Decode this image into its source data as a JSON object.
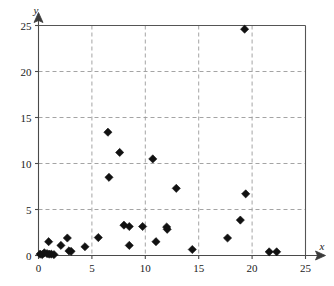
{
  "chart_data": {
    "type": "scatter",
    "title": "",
    "subtitle": "",
    "xlabel": "x",
    "ylabel": "y",
    "xlim": [
      0,
      25
    ],
    "ylim": [
      0,
      25
    ],
    "xticks": [
      0,
      5,
      10,
      15,
      20,
      25
    ],
    "yticks": [
      0,
      5,
      10,
      15,
      20,
      25
    ],
    "xtick_labels": [
      "0",
      "5",
      "10",
      "15",
      "20",
      "25"
    ],
    "ytick_labels": [
      "0",
      "5",
      "10",
      "15",
      "20",
      "25"
    ],
    "grid": true,
    "grid_style": "dashed",
    "legend": "none",
    "marker": "diamond",
    "marker_color": "#111111",
    "series": [
      {
        "name": "data",
        "points": [
          [
            0.15,
            0.15
          ],
          [
            0.35,
            0.1
          ],
          [
            0.55,
            0.3
          ],
          [
            0.8,
            0.2
          ],
          [
            0.95,
            1.5
          ],
          [
            1.0,
            0.15
          ],
          [
            1.2,
            0.15
          ],
          [
            1.45,
            0.1
          ],
          [
            2.1,
            1.1
          ],
          [
            2.7,
            1.9
          ],
          [
            2.85,
            0.5
          ],
          [
            3.05,
            0.45
          ],
          [
            4.35,
            0.95
          ],
          [
            5.6,
            1.95
          ],
          [
            6.5,
            13.4
          ],
          [
            6.6,
            8.5
          ],
          [
            7.6,
            11.2
          ],
          [
            8.0,
            3.3
          ],
          [
            8.5,
            3.15
          ],
          [
            8.5,
            1.1
          ],
          [
            9.75,
            3.15
          ],
          [
            10.7,
            10.5
          ],
          [
            11.0,
            1.5
          ],
          [
            12.0,
            3.1
          ],
          [
            12.05,
            2.85
          ],
          [
            12.9,
            7.3
          ],
          [
            14.4,
            0.65
          ],
          [
            17.7,
            1.9
          ],
          [
            18.9,
            3.85
          ],
          [
            19.3,
            24.6
          ],
          [
            19.4,
            6.7
          ],
          [
            21.6,
            0.4
          ],
          [
            22.3,
            0.4
          ]
        ]
      }
    ]
  },
  "axes": {
    "x_axis_label": "x",
    "y_axis_label": "y"
  }
}
